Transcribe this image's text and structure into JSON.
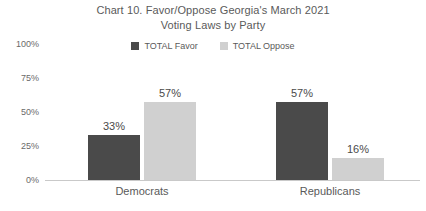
{
  "chart_data": {
    "type": "bar",
    "title": "Chart 10. Favor/Oppose Georgia's March 2021 Voting Laws by Party",
    "title_lines": [
      "Chart 10. Favor/Oppose Georgia's March 2021",
      "Voting Laws by Party"
    ],
    "categories": [
      "Democrats",
      "Republicans"
    ],
    "series": [
      {
        "name": "TOTAL Favor",
        "color": "#4a4a4a",
        "values": [
          33,
          57
        ],
        "value_labels": [
          "33%",
          "57%"
        ]
      },
      {
        "name": "TOTAL Oppose",
        "color": "#d0d0d0",
        "values": [
          57,
          16
        ],
        "value_labels": [
          "57%",
          "16%"
        ]
      }
    ],
    "xlabel": "",
    "ylabel": "",
    "ylim": [
      0,
      100
    ],
    "yticks": [
      100,
      75,
      50,
      25,
      0
    ],
    "ytick_labels": [
      "100%",
      "75%",
      "50%",
      "25%",
      "0%"
    ],
    "grid": false,
    "legend_position": "top-center",
    "axis_color": "#c9c9c9",
    "background": "#ffffff",
    "text_color": "#5a5a5a"
  }
}
